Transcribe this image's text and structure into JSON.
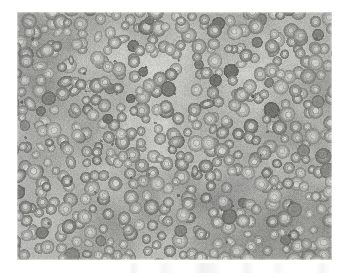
{
  "figure": {
    "kind": "photomicrograph",
    "specimen_label": "red blood cells",
    "stain": "Wright-Giemsa",
    "rendering": "grayscale light microscopy",
    "caption": "",
    "caption_visible": false,
    "page_background": "#ffffff"
  },
  "panel": {
    "name": "micrograph-panel",
    "x": 17,
    "y": 12,
    "width": 315,
    "height": 248,
    "background_color": "#c9c9c5"
  },
  "palette": {
    "page_white": "#ffffff",
    "field_background": "#c9c9c5",
    "field_background_light": "#d2d2ce",
    "field_background_dark": "#c0c0bc",
    "cell_rim": "#8e8e8a",
    "cell_rim_dark": "#7a7a76",
    "cell_center": "#bdbdb9",
    "cell_dense": "#6e6e6a",
    "platelet": "#5a5a57",
    "vignette": "#b9b9b5"
  },
  "field": {
    "cell_count": 520,
    "cell_diameter_min": 9,
    "cell_diameter_max": 17,
    "cell_diameter_mean": 13,
    "rim_thickness_min": 2,
    "rim_thickness_max": 4,
    "dense_cell_fraction": 0.07,
    "elongated_cell_fraction": 0.05,
    "platelet_count": 34,
    "platelet_size_min": 2,
    "platelet_size_max": 4,
    "seed": 20240517,
    "noise_opacity": 0.16,
    "blur_px": 0.35
  },
  "features": {
    "central_pallor": true,
    "overlapping_cells": true,
    "even_distribution": true,
    "vignette_corners": true
  }
}
